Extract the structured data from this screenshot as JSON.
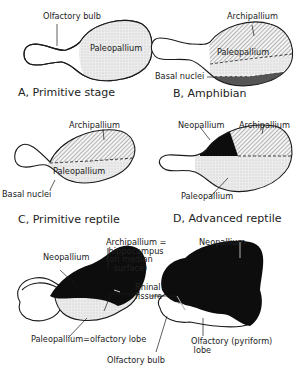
{
  "figure": {
    "panels": [
      {
        "id": "A",
        "caption": "A, Primitive stage",
        "labels": {
          "olfactory_bulb": "Olfactory bulb",
          "paleopallium": "Paleopallium"
        }
      },
      {
        "id": "B",
        "caption": "B, Amphibian",
        "labels": {
          "archipallium": "Archipallium",
          "paleopallium": "Paleopallium",
          "basal_nuclei": "Basal nuclei"
        }
      },
      {
        "id": "C",
        "caption": "C, Primitive reptile",
        "labels": {
          "archipallium": "Archipallium",
          "paleopallium": "Paleopallium",
          "basal_nuclei": "Basal nuclei"
        }
      },
      {
        "id": "D",
        "caption": "D, Advanced reptile",
        "labels": {
          "neopallium": "Neopallium",
          "archipallium": "Archipallium",
          "paleopallium": "Paleopallium"
        }
      },
      {
        "id": "E",
        "caption": "",
        "labels": {
          "neopallium_left": "Neopallium",
          "archipallium_hippocampus": "Archipallium =\n hippocampus\n(on median\n   surface)",
          "rhinal_fissure": "Rhinal\nfissure",
          "paleopallium_olfactory_lobe": "Paleopallium=olfactory lobe",
          "neopallium_right": "Neopallium",
          "olfactory_pyriform_lobe": "Olfactory (pyriform)\n lobe",
          "olfactory_bulb": "Olfactory bulb"
        }
      }
    ],
    "legend_fills": {
      "paleopallium": "stippled light gray",
      "archipallium": "diagonal hatching",
      "basal_nuclei": "dark gray",
      "neopallium": "solid black"
    },
    "colors": {
      "ink": "#1a1a1a",
      "stipple": "#e6e6e6",
      "basal": "#555555",
      "neo": "#0d0d0d"
    }
  }
}
